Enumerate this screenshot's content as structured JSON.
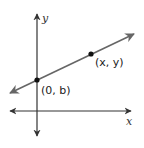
{
  "diagram": {
    "type": "coordinate-plane-line",
    "axes": {
      "x_label": "x",
      "y_label": "y",
      "color": "#333333"
    },
    "line": {
      "color": "#666666",
      "description": "straight line with positive slope crossing y-axis above origin"
    },
    "points": [
      {
        "label": "(0, b)",
        "name": "y-intercept"
      },
      {
        "label": "(x, y)",
        "name": "general-point"
      }
    ],
    "point_color": "#111111"
  }
}
